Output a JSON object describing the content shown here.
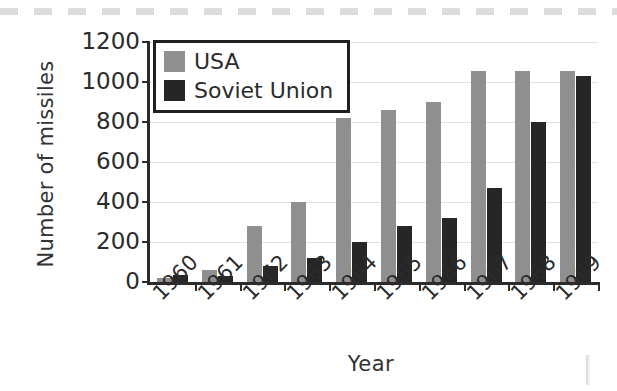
{
  "chart_data": {
    "type": "bar",
    "title": "",
    "xlabel": "Year",
    "ylabel": "Number of missiles",
    "categories": [
      "1960",
      "1961",
      "1962",
      "1963",
      "1964",
      "1965",
      "1966",
      "1967",
      "1968",
      "1969"
    ],
    "series": [
      {
        "name": "USA",
        "color": "#8f8f8f",
        "values": [
          18,
          60,
          280,
          400,
          820,
          860,
          900,
          1054,
          1054,
          1054
        ]
      },
      {
        "name": "Soviet Union",
        "color": "#262626",
        "values": [
          35,
          30,
          80,
          120,
          200,
          280,
          320,
          470,
          800,
          1030
        ]
      }
    ],
    "ylim": [
      0,
      1200
    ],
    "yticks": [
      0,
      200,
      400,
      600,
      800,
      1000,
      1200
    ],
    "ytick_labels": [
      "0",
      "200",
      "400",
      "600",
      "800",
      "1000",
      "1200"
    ],
    "grid": true,
    "legend_position": "upper-left",
    "xtick_rotation": -45
  },
  "legend": {
    "items": [
      {
        "label": "USA",
        "color": "#8f8f8f"
      },
      {
        "label": "Soviet Union",
        "color": "#262626"
      }
    ]
  },
  "axes": {
    "y_title": "Number of missiles",
    "x_title": "Year"
  }
}
